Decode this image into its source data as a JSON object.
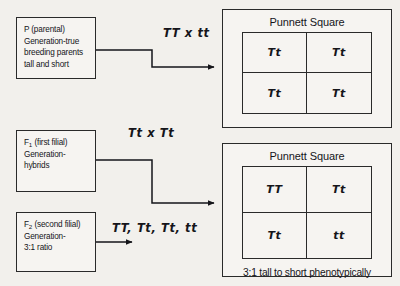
{
  "generations": [
    {
      "key": "p",
      "lines": [
        "P (parental)",
        "Generation-true",
        "breeding parents",
        "tall and short"
      ],
      "label_main": "P",
      "label_sub": ""
    },
    {
      "key": "f1",
      "lines": [
        "F",
        " (first filial)",
        "Generation-",
        "hybrids"
      ],
      "label_main": "F",
      "label_sub": "1",
      "line1_rest": " (first filial)",
      "line2": "Generation-",
      "line3": "hybrids"
    },
    {
      "key": "f2",
      "lines": [
        "F",
        " (second filial)",
        "Generation-",
        "3:1 ratio"
      ],
      "label_main": "F",
      "label_sub": "2",
      "line1_rest": " (second filial)",
      "line2": "Generation-",
      "line3": "3:1 ratio"
    }
  ],
  "box_p": {
    "line1": "P (parental)",
    "line2": "Generation-true",
    "line3": "breeding parents",
    "line4": "tall and short"
  },
  "box_f1": {
    "label_main": "F",
    "label_sub": "1",
    "line1_rest": " (first filial)",
    "line2": "Generation-",
    "line3": "hybrids"
  },
  "box_f2": {
    "label_main": "F",
    "label_sub": "2",
    "line1_rest": " (second filial)",
    "line2": "Generation-",
    "line3": "3:1 ratio"
  },
  "crosses": {
    "parental": "TT x tt",
    "f1": "Tt x Tt",
    "f2": "TT, Tt, Tt, tt"
  },
  "punnett_1": {
    "title": "Punnett Square",
    "cells": [
      "Tt",
      "Tt",
      "Tt",
      "Tt"
    ],
    "footnote": ""
  },
  "punnett_2": {
    "title": "Punnett Square",
    "cells": [
      "TT",
      "Tt",
      "Tt",
      "tt"
    ],
    "footnote": "3:1 tall to short phenotypically"
  },
  "colors": {
    "background": "#f2f0ec",
    "panel": "#f6f4f1",
    "ink": "#15151a",
    "border": "#2a2a2a"
  }
}
